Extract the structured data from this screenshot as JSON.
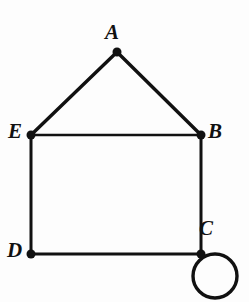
{
  "figure": {
    "kind": "undirected-graph-diagram",
    "background_color": "#fdfdfd",
    "stroke_color": "#111111",
    "label_color": "#111111",
    "width": 249,
    "height": 302
  },
  "graph": {
    "vertices": [
      {
        "id": "A",
        "label": "A",
        "x": 117,
        "y": 52,
        "label_x": 105,
        "label_y": 22,
        "dot_radius": 4.5
      },
      {
        "id": "E",
        "label": "E",
        "x": 31,
        "y": 135,
        "label_x": 8,
        "label_y": 121,
        "dot_radius": 4.5
      },
      {
        "id": "B",
        "label": "B",
        "x": 201,
        "y": 135,
        "label_x": 208,
        "label_y": 121,
        "dot_radius": 4.5
      },
      {
        "id": "D",
        "label": "D",
        "x": 31,
        "y": 254,
        "label_x": 7,
        "label_y": 240,
        "dot_radius": 4.5
      },
      {
        "id": "C",
        "label": "C",
        "x": 201,
        "y": 254,
        "label_x": 199,
        "label_y": 218,
        "dot_radius": 4.5
      }
    ],
    "edges": [
      {
        "id": "A-E",
        "from": "A",
        "to": "E",
        "width": 3.4
      },
      {
        "id": "A-B",
        "from": "A",
        "to": "B",
        "width": 3.4
      },
      {
        "id": "E-B",
        "from": "E",
        "to": "B",
        "width": 2.6
      },
      {
        "id": "E-D",
        "from": "E",
        "to": "D",
        "width": 3.0
      },
      {
        "id": "B-C",
        "from": "B",
        "to": "C",
        "width": 3.0
      },
      {
        "id": "D-C",
        "from": "D",
        "to": "C",
        "width": 3.0
      }
    ],
    "self_loops": [
      {
        "id": "C-C",
        "at": "C",
        "center_x": 215,
        "center_y": 276,
        "radius": 22,
        "width": 3.4
      }
    ]
  }
}
